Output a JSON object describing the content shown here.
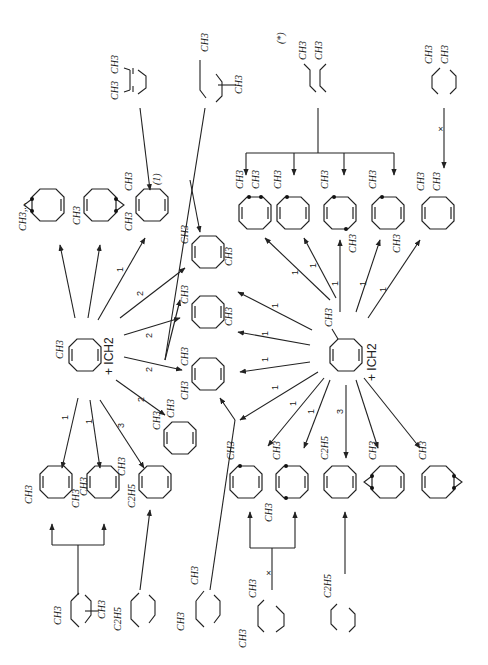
{
  "figure": {
    "orientation": "rotated 90 degrees counter-clockwise (scanned page)",
    "reactants": [
      {
        "id": "r1",
        "ring": "1-methylcycloocta-1,5-diene",
        "substituent": "CH3",
        "reagent": "+ ICH2"
      },
      {
        "id": "r2",
        "ring": "3-methylcycloocta-1,5-diene",
        "substituent": "CH3",
        "reagent": "+ ICH2"
      }
    ],
    "reagent_label": "+ ICH2",
    "substituent_labels": {
      "methyl": "CH3",
      "ethyl": "C2H5",
      "cyclopropane_methyl": "CH3,..."
    },
    "marks": {
      "asterisk": "(*)",
      "footnote_1": "(1)",
      "blocked": "×"
    },
    "arrow_weights_r1": [
      "1",
      "1",
      "1",
      "2",
      "2",
      "2",
      "2",
      "1",
      "1",
      "3"
    ],
    "arrow_weights_r2": [
      "1",
      "1",
      "1",
      "1",
      "1",
      "1",
      "1",
      "1",
      "1",
      "1",
      "1",
      "1",
      "3"
    ],
    "dienes_top": [
      {
        "id": "d1",
        "labels": [
          "CH3",
          "CH3"
        ]
      },
      {
        "id": "d2",
        "labels": [
          "CH3",
          "CH3"
        ]
      },
      {
        "id": "d3",
        "labels": [
          "CH3",
          "CH3"
        ],
        "mark": "(*)"
      },
      {
        "id": "d4",
        "labels": [
          "CH3",
          "CH3"
        ],
        "blocked": true
      }
    ],
    "dienes_bottom": [
      {
        "id": "d5",
        "labels": [
          "CH3",
          "CH3"
        ]
      },
      {
        "id": "d6",
        "labels": [
          "C2H5",
          "CH3"
        ]
      },
      {
        "id": "d7",
        "labels": [
          "CH3",
          "CH3"
        ]
      },
      {
        "id": "d8",
        "labels": [
          "CH3",
          "CH3"
        ],
        "blocked": true
      },
      {
        "id": "d9",
        "labels": [
          "C2H5"
        ]
      }
    ]
  }
}
